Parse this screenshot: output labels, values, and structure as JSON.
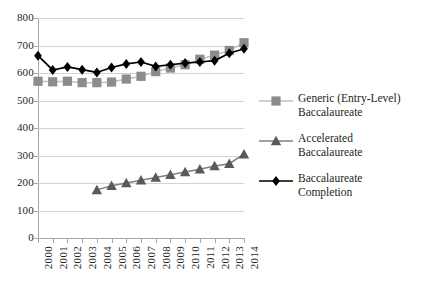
{
  "chart_data": {
    "type": "line",
    "title": "",
    "subtitle": "",
    "xlabel": "",
    "ylabel": "",
    "grid": true,
    "legend_position": "right",
    "categories": [
      "2000",
      "2001",
      "2002",
      "2003",
      "2004",
      "2005",
      "2006",
      "2007",
      "2008",
      "2009",
      "2010",
      "2011",
      "2012",
      "2013",
      "2014"
    ],
    "x": [
      2000,
      2001,
      2002,
      2003,
      2004,
      2005,
      2006,
      2007,
      2008,
      2009,
      2010,
      2011,
      2012,
      2013,
      2014
    ],
    "ylim": [
      0,
      800
    ],
    "xlim": [
      2000,
      2014
    ],
    "y_ticks": [
      0,
      100,
      200,
      300,
      400,
      500,
      600,
      700,
      800
    ],
    "series": [
      {
        "name": "Generic (Entry-Level) Baccalaureate",
        "marker": "square",
        "color": "#8c8c8c",
        "line_color": "#bfbfbf",
        "values": [
          570,
          568,
          570,
          565,
          565,
          567,
          578,
          588,
          605,
          618,
          630,
          650,
          665,
          682,
          710
        ]
      },
      {
        "name": "Accelerated Baccalaureate",
        "marker": "triangle",
        "color": "#595959",
        "line_color": "#7f7f7f",
        "values": [
          null,
          null,
          null,
          null,
          175,
          190,
          200,
          210,
          220,
          230,
          240,
          250,
          262,
          270,
          305
        ]
      },
      {
        "name": "Baccalaureate Completion",
        "marker": "diamond",
        "color": "#000000",
        "line_color": "#000000",
        "values": [
          663,
          611,
          622,
          612,
          602,
          620,
          633,
          640,
          624,
          630,
          636,
          640,
          645,
          672,
          688
        ]
      }
    ],
    "legend": [
      {
        "label_line1": "Generic (Entry-Level)",
        "label_line2": "Baccalaureate",
        "marker": "square",
        "color": "#8c8c8c",
        "line_color": "#bfbfbf"
      },
      {
        "label_line1": "Accelerated",
        "label_line2": "Baccalaureate",
        "marker": "triangle",
        "color": "#595959",
        "line_color": "#7f7f7f"
      },
      {
        "label_line1": "Baccalaureate",
        "label_line2": "Completion",
        "marker": "diamond",
        "color": "#000000",
        "line_color": "#000000"
      }
    ]
  }
}
